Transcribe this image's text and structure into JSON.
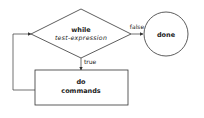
{
  "diagram": {
    "type": "flowchart",
    "nodes": {
      "condition": {
        "shape": "diamond",
        "line1": "while",
        "line2": "test-expression"
      },
      "body": {
        "shape": "rectangle",
        "line1": "do",
        "line2": "commands"
      },
      "end": {
        "shape": "circle",
        "label": "done"
      }
    },
    "edges": {
      "false_label": "false",
      "true_label": "true"
    },
    "colors": {
      "stroke": "#333333",
      "text": "#222222",
      "background": "#ffffff"
    }
  }
}
